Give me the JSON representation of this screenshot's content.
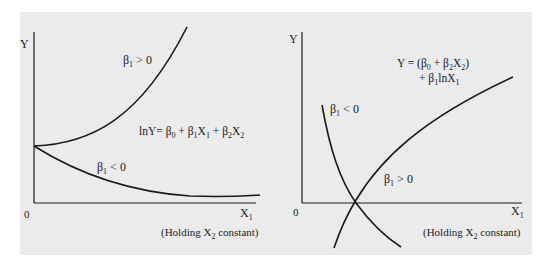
{
  "left_panel": {
    "y_axis_label": "Y",
    "x_axis_label": "X",
    "x_axis_sub": "1",
    "origin_label": "0",
    "curve_up_label": {
      "beta": "β",
      "sub": "1",
      "rel": " > 0"
    },
    "curve_down_label": {
      "beta": "β",
      "sub": "1",
      "rel": " < 0"
    },
    "equation": {
      "lhs": "lnY= ",
      "b0": "β",
      "b0_sub": "0",
      "plus1": " + ",
      "b1": "β",
      "b1_sub": "1",
      "x1": "X",
      "x1_sub": "1",
      "plus2": " + ",
      "b2": "β",
      "b2_sub": "2",
      "x2": "X",
      "x2_sub": "2"
    },
    "note": {
      "pre": "(Holding X",
      "sub": "2",
      "post": " constant)"
    }
  },
  "right_panel": {
    "y_axis_label": "Y",
    "x_axis_label": "X",
    "x_axis_sub": "1",
    "origin_label": "0",
    "curve_down_label": {
      "beta": "β",
      "sub": "1",
      "rel": " < 0"
    },
    "curve_up_label": {
      "beta": "β",
      "sub": "1",
      "rel": " > 0"
    },
    "equation_line1": {
      "pre": "Y = (β",
      "sub0": "0",
      "mid": " + β",
      "sub2": "2",
      "x": "X",
      "subx": "2",
      "post": ")"
    },
    "equation_line2": {
      "pre": "+ β",
      "sub1": "1",
      "mid": "lnX",
      "subx": "1"
    },
    "note": {
      "pre": "(Holding X",
      "sub": "2",
      "post": " constant)"
    }
  },
  "colors": {
    "background": "#ebebeb",
    "line": "#1a1a1a"
  }
}
